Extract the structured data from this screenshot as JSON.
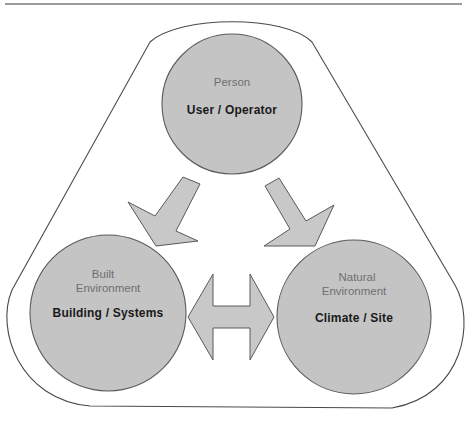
{
  "diagram": {
    "type": "relationship-triangle",
    "colors": {
      "node_fill": "#c4c4c4",
      "node_stroke": "#5a5a5a",
      "arrow_fill": "#c8c8c8",
      "outline_stroke": "#4a4a4a",
      "rule_line": "#7a7a7a",
      "sub_text": "#6f6f6f",
      "main_text": "#1a1a1a"
    },
    "nodes": [
      {
        "id": "person",
        "category": "Person",
        "category_line2": "",
        "title": "User / Operator"
      },
      {
        "id": "built",
        "category": "Built",
        "category_line2": "Environment",
        "title": "Building / Systems"
      },
      {
        "id": "natural",
        "category": "Natural",
        "category_line2": "Environment",
        "title": "Climate / Site"
      }
    ],
    "arrows": [
      {
        "from": "Person",
        "to": "Built Environment",
        "direction": "one-way"
      },
      {
        "from": "Person",
        "to": "Natural Environment",
        "direction": "one-way"
      },
      {
        "from": "Built Environment",
        "to": "Natural Environment",
        "direction": "two-way"
      }
    ]
  }
}
